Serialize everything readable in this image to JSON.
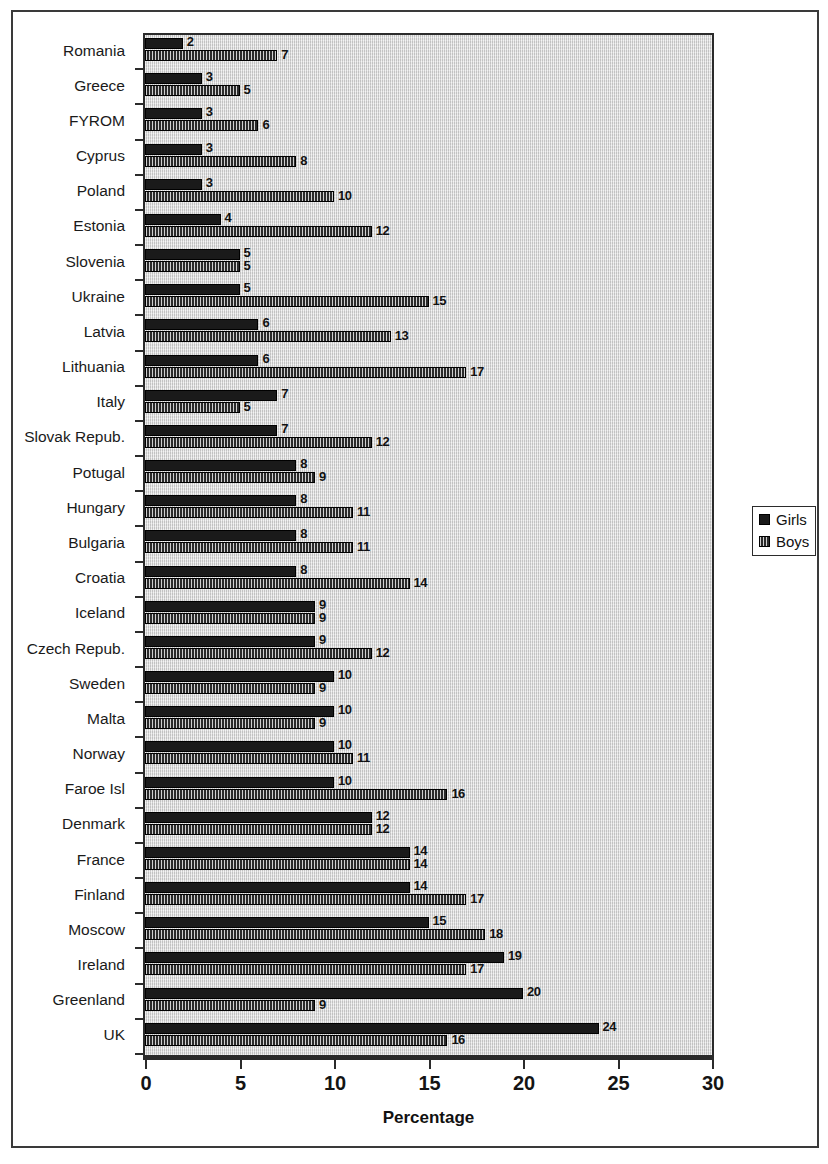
{
  "figure": {
    "caption": "",
    "legend": {
      "position": "right",
      "entries": [
        {
          "label": "Girls",
          "swatch": "solid-dark-square-icon"
        },
        {
          "label": "Boys",
          "swatch": "hatched-square-icon"
        }
      ]
    }
  },
  "chart_data": {
    "type": "bar",
    "orientation": "horizontal",
    "title": "",
    "xlabel": "Percentage",
    "ylabel": "",
    "xlim": [
      0,
      30
    ],
    "xticks": [
      0,
      5,
      10,
      15,
      20,
      25,
      30
    ],
    "grid": false,
    "legend": [
      "Girls",
      "Boys"
    ],
    "categories": [
      "Romania",
      "Greece",
      "FYROM",
      "Cyprus",
      "Poland",
      "Estonia",
      "Slovenia",
      "Ukraine",
      "Latvia",
      "Lithuania",
      "Italy",
      "Slovak Repub.",
      "Potugal",
      "Hungary",
      "Bulgaria",
      "Croatia",
      "Iceland",
      "Czech Repub.",
      "Sweden",
      "Malta",
      "Norway",
      "Faroe Isl",
      "Denmark",
      "France",
      "Finland",
      "Moscow",
      "Ireland",
      "Greenland",
      "UK"
    ],
    "series": [
      {
        "name": "Girls",
        "values": [
          2,
          3,
          3,
          3,
          3,
          4,
          5,
          5,
          6,
          6,
          7,
          7,
          8,
          8,
          8,
          8,
          9,
          9,
          10,
          10,
          10,
          10,
          12,
          14,
          14,
          15,
          19,
          20,
          24
        ]
      },
      {
        "name": "Boys",
        "values": [
          7,
          5,
          6,
          8,
          10,
          12,
          5,
          15,
          13,
          17,
          5,
          12,
          9,
          11,
          11,
          14,
          9,
          12,
          9,
          9,
          11,
          16,
          12,
          14,
          17,
          18,
          17,
          9,
          16
        ]
      }
    ]
  }
}
